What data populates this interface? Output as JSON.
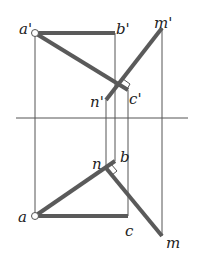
{
  "diagram": {
    "type": "orthographic-projection",
    "colors": {
      "thick_line": "#5a5a5a",
      "thin_line": "#555555",
      "label": "#222222",
      "background": "#ffffff"
    },
    "axis": {
      "x1": 16,
      "y": 118,
      "x2": 188
    },
    "front_view": {
      "points": {
        "a_prime": {
          "label": "a'",
          "x": 35,
          "y": 33
        },
        "b_prime": {
          "label": "b'",
          "x": 115,
          "y": 33
        },
        "m_prime": {
          "label": "m'",
          "x": 162,
          "y": 28
        },
        "n_prime": {
          "label": "n'",
          "x": 106,
          "y": 100
        },
        "c_prime": {
          "label": "c'",
          "x": 128,
          "y": 90
        }
      }
    },
    "top_view": {
      "points": {
        "a": {
          "label": "a",
          "x": 35,
          "y": 216
        },
        "b": {
          "label": "b",
          "x": 115,
          "y": 161
        },
        "c": {
          "label": "c",
          "x": 128,
          "y": 216
        },
        "n": {
          "label": "n",
          "x": 106,
          "y": 168
        },
        "m": {
          "label": "m",
          "x": 162,
          "y": 236
        }
      }
    },
    "labels": {
      "a_prime": "a'",
      "b_prime": "b'",
      "m_prime": "m'",
      "n_prime": "n'",
      "c_prime": "c'",
      "a": "a",
      "b": "b",
      "c": "c",
      "n": "n",
      "m": "m"
    }
  }
}
